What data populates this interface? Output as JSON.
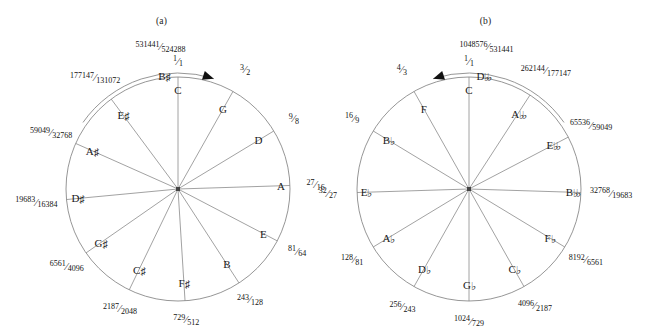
{
  "figure": {
    "width": 647,
    "height": 329,
    "background": "#ffffff",
    "line_color": "#8a8a8a",
    "text_color": "#111111"
  },
  "panels": [
    {
      "id": "a",
      "caption": "(a)",
      "direction": "clockwise",
      "arrow_name": "clockwise-arrow",
      "center": {
        "x": 178,
        "y": 189
      },
      "radius": 112,
      "nodes": [
        {
          "note": "C",
          "accidental": "",
          "ratio_num": "1",
          "ratio_den": "1",
          "angle_deg": -90.0,
          "label_r": 0.88,
          "frac_r": 1.14
        },
        {
          "note": "G",
          "accidental": "",
          "ratio_num": "3",
          "ratio_den": "2",
          "angle_deg": -60.6,
          "label_r": 0.82,
          "frac_r": 1.22
        },
        {
          "note": "D",
          "accidental": "",
          "ratio_num": "9",
          "ratio_den": "8",
          "angle_deg": -31.2,
          "label_r": 0.84,
          "frac_r": 1.21
        },
        {
          "note": "A",
          "accidental": "",
          "ratio_num": "27",
          "ratio_den": "16",
          "angle_deg": -1.8,
          "label_r": 0.92,
          "frac_r": 1.23
        },
        {
          "note": "E",
          "accidental": "",
          "ratio_num": "81",
          "ratio_den": "64",
          "angle_deg": 27.6,
          "label_r": 0.86,
          "frac_r": 1.2
        },
        {
          "note": "B",
          "accidental": "",
          "ratio_num": "243",
          "ratio_den": "128",
          "angle_deg": 57.0,
          "label_r": 0.8,
          "frac_r": 1.18
        },
        {
          "note": "F",
          "accidental": "sharp",
          "ratio_num": "729",
          "ratio_den": "512",
          "angle_deg": 86.4,
          "label_r": 0.84,
          "frac_r": 1.17
        },
        {
          "note": "C",
          "accidental": "sharp",
          "ratio_num": "2187",
          "ratio_den": "2048",
          "angle_deg": 115.8,
          "label_r": 0.8,
          "frac_r": 1.19
        },
        {
          "note": "G",
          "accidental": "sharp",
          "ratio_num": "6561",
          "ratio_den": "4096",
          "angle_deg": 145.2,
          "label_r": 0.84,
          "frac_r": 1.21
        },
        {
          "note": "D",
          "accidental": "sharp",
          "ratio_num": "19683",
          "ratio_den": "16384",
          "angle_deg": 174.6,
          "label_r": 0.9,
          "frac_r": 1.27
        },
        {
          "note": "A",
          "accidental": "sharp",
          "ratio_num": "59049",
          "ratio_den": "32768",
          "angle_deg": -156.0,
          "label_r": 0.84,
          "frac_r": 1.24
        },
        {
          "note": "E",
          "accidental": "sharp",
          "ratio_num": "177147",
          "ratio_den": "131072",
          "angle_deg": -126.6,
          "label_r": 0.82,
          "frac_r": 1.24
        },
        {
          "note": "B",
          "accidental": "sharp",
          "ratio_num": "531441",
          "ratio_den": "524288",
          "angle_deg": -97.0,
          "label_r": 1.02,
          "frac_r": 1.28,
          "spoke": false
        }
      ]
    },
    {
      "id": "b",
      "caption": "(b)",
      "direction": "counter-clockwise",
      "arrow_name": "counter-clockwise-arrow",
      "center": {
        "x": 145,
        "y": 189
      },
      "radius": 112,
      "nodes": [
        {
          "note": "C",
          "accidental": "",
          "ratio_num": "1",
          "ratio_den": "1",
          "angle_deg": -90.0,
          "label_r": 0.88,
          "frac_r": 1.14
        },
        {
          "note": "F",
          "accidental": "",
          "ratio_num": "4",
          "ratio_den": "3",
          "angle_deg": -119.4,
          "label_r": 0.82,
          "frac_r": 1.22
        },
        {
          "note": "B",
          "accidental": "flat",
          "ratio_num": "16",
          "ratio_den": "9",
          "angle_deg": -148.8,
          "label_r": 0.84,
          "frac_r": 1.22
        },
        {
          "note": "E",
          "accidental": "flat",
          "ratio_num": "32",
          "ratio_den": "27",
          "angle_deg": 178.2,
          "label_r": 0.92,
          "frac_r": 1.26
        },
        {
          "note": "A",
          "accidental": "flat",
          "ratio_num": "128",
          "ratio_den": "81",
          "angle_deg": 148.8,
          "label_r": 0.84,
          "frac_r": 1.22
        },
        {
          "note": "D",
          "accidental": "flat",
          "ratio_num": "256",
          "ratio_den": "243",
          "angle_deg": 119.4,
          "label_r": 0.82,
          "frac_r": 1.21
        },
        {
          "note": "G",
          "accidental": "flat",
          "ratio_num": "1024",
          "ratio_den": "729",
          "angle_deg": 90.0,
          "label_r": 0.86,
          "frac_r": 1.18
        },
        {
          "note": "C",
          "accidental": "flat",
          "ratio_num": "4096",
          "ratio_den": "2187",
          "angle_deg": 60.6,
          "label_r": 0.82,
          "frac_r": 1.2
        },
        {
          "note": "F",
          "accidental": "flat",
          "ratio_num": "8192",
          "ratio_den": "6561",
          "angle_deg": 31.2,
          "label_r": 0.84,
          "frac_r": 1.22
        },
        {
          "note": "B",
          "accidental": "dblflat",
          "ratio_num": "32768",
          "ratio_den": "19683",
          "angle_deg": 1.8,
          "label_r": 0.92,
          "frac_r": 1.27
        },
        {
          "note": "E",
          "accidental": "dblflat",
          "ratio_num": "65536",
          "ratio_den": "59049",
          "angle_deg": -27.6,
          "label_r": 0.84,
          "frac_r": 1.23
        },
        {
          "note": "A",
          "accidental": "dblflat",
          "ratio_num": "262144",
          "ratio_den": "177147",
          "angle_deg": -57.0,
          "label_r": 0.8,
          "frac_r": 1.26
        },
        {
          "note": "D",
          "accidental": "dblflat",
          "ratio_num": "1048576",
          "ratio_den": "531441",
          "angle_deg": -83.0,
          "label_r": 1.02,
          "frac_r": 1.28,
          "spoke": false
        }
      ]
    }
  ],
  "glyphs": {
    "sharp": "♯",
    "flat": "♭",
    "dblflat": "♭♭",
    "dblsharp": "♯♯"
  }
}
